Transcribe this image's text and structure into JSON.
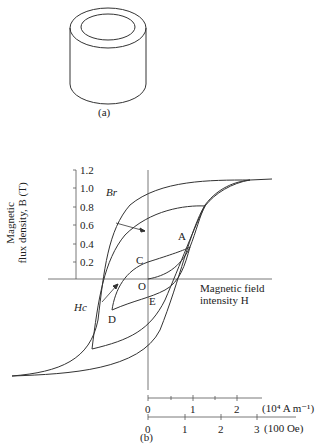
{
  "figure_a": {
    "caption": "(a)",
    "object": "hollow cylindrical ring (toroid core)"
  },
  "figure_b": {
    "caption": "(b)",
    "y_axis": {
      "label_line1": "Magnetic",
      "label_line2": "flux density, B (T)",
      "ticks": [
        "1.2",
        "1.0",
        "0.8",
        "0.6",
        "0.4",
        "0.2"
      ]
    },
    "x_axis": {
      "label_line1": "Magnetic field",
      "label_line2": "intensity H",
      "si_ticks": [
        "0",
        "1",
        "2"
      ],
      "si_unit": "(10⁴ A m⁻¹)",
      "cgs_ticks": [
        "0",
        "1",
        "2",
        "3"
      ],
      "cgs_unit": "(100 Oe)"
    },
    "annotations": {
      "br": "Br",
      "hc": "Hc",
      "point_a": "A",
      "point_c": "C",
      "point_o": "O",
      "point_d": "D",
      "point_e": "E"
    }
  }
}
